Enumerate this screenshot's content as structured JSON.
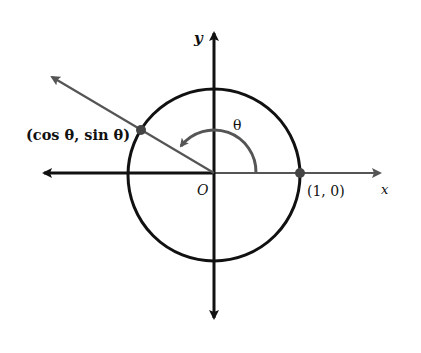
{
  "diagram": {
    "labels": {
      "y_axis": "y",
      "x_axis": "x",
      "origin": "O",
      "theta": "θ",
      "point_on_circle": "(cos θ, sin θ)",
      "point_one_zero": "(1, 0)"
    },
    "elements": {
      "circle": "unit circle centered at origin",
      "x_axis": "horizontal axis with arrows at both ends",
      "y_axis": "vertical axis with arrows at both ends",
      "terminal_ray": "ray from origin through (cos θ, sin θ)",
      "angle_arc": "arc from positive x-axis to terminal ray marked θ"
    },
    "colors": {
      "axes": "#111111",
      "circle": "#111111",
      "ray": "#555555",
      "arc": "#555555",
      "points": "#444444"
    }
  }
}
